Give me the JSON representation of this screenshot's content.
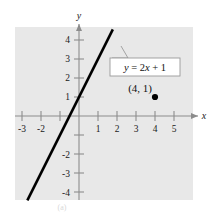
{
  "figure": {
    "caption": "(a)",
    "plot_bg_color": "#e8e8e8",
    "axis_color": "#8c8c8c",
    "line_color": "#000000"
  },
  "axes": {
    "x_name": "x",
    "y_name": "y",
    "x_tick_labels": [
      "-3",
      "-2",
      "1",
      "2",
      "3",
      "4",
      "5"
    ],
    "y_tick_labels": [
      "4",
      "3",
      "2",
      "1",
      "-2",
      "-3",
      "-4"
    ]
  },
  "annotations": {
    "equation_label": "y = 2x + 1",
    "equation_lhs": "y",
    "equation_eq": " = 2",
    "equation_var": "x",
    "equation_rhs": " + 1",
    "point_label": "(4, 1)"
  },
  "chart_data": {
    "type": "line",
    "title": "",
    "xlabel": "x",
    "ylabel": "y",
    "xlim": [
      -3.4,
      5.6
    ],
    "ylim": [
      -4.6,
      4.7
    ],
    "grid": false,
    "legend": null,
    "xticks": [
      -3,
      -2,
      -1,
      1,
      2,
      3,
      4,
      5
    ],
    "xtick_labels": [
      "-3",
      "-2",
      "",
      "1",
      "2",
      "3",
      "4",
      "5"
    ],
    "yticks": [
      4,
      3,
      2,
      1,
      -1,
      -2,
      -3,
      -4
    ],
    "ytick_labels": [
      "4",
      "3",
      "2",
      "1",
      "",
      "-2",
      "-3",
      "-4"
    ],
    "series": [
      {
        "name": "y = 2x + 1",
        "type": "line",
        "equation": "y = 2x + 1",
        "slope": 2,
        "intercept": 1,
        "x": [
          -2.72,
          1.78
        ],
        "y": [
          -4.44,
          4.56
        ]
      },
      {
        "name": "point",
        "type": "scatter",
        "x": [
          4
        ],
        "y": [
          1
        ],
        "labels": [
          "(4, 1)"
        ]
      }
    ],
    "annotations": [
      {
        "text": "y = 2x + 1",
        "x": 1.6,
        "y": 2.0,
        "points_to_x": 1.35,
        "points_to_y": 3.7
      }
    ]
  }
}
